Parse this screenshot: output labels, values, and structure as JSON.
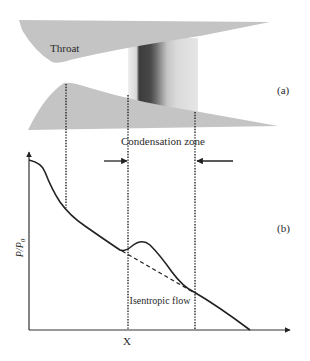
{
  "figure": {
    "panel_a": {
      "label": "(a)",
      "throat_label": "Throat",
      "nozzle_color": "#c4c4c4"
    },
    "panel_b": {
      "label": "(b)",
      "condensation_zone_label": "Condensation zone",
      "isentropic_flow_label": "Isentropic flow",
      "y_axis_label": "P/P0",
      "y_axis_label_main": "P/P",
      "y_axis_label_sub": "0",
      "x_axis_label": "X"
    }
  }
}
